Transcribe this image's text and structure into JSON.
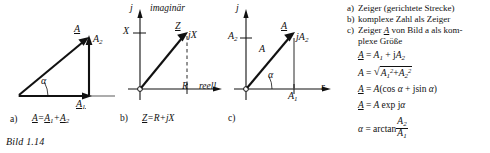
{
  "figure": {
    "caption": "Bild 1.14"
  },
  "diagram_a": {
    "item_letter": "a)",
    "labels": {
      "resultant": "A",
      "component_vertical": "A",
      "component_vertical_sub": "2",
      "component_horizontal": "A",
      "component_horizontal_sub": "1",
      "angle": "α"
    },
    "equation": {
      "lhs": "A",
      "eq": "=",
      "term1": "A",
      "term1_sub": "1",
      "plus": "+",
      "term2": "A",
      "term2_sub": "2"
    }
  },
  "diagram_b": {
    "item_letter": "b)",
    "axes": {
      "vertical_symbol": "j",
      "vertical_tick_label": "X",
      "vertical_name": "imaginär",
      "horizontal_tick_label": "R",
      "horizontal_name": "reell"
    },
    "labels": {
      "phasor": "Z",
      "imag_component": "jX"
    },
    "equation": {
      "lhs": "Z",
      "eq": "=",
      "term1": "R",
      "plus": "+",
      "term2": "jX"
    }
  },
  "diagram_c": {
    "item_letter": "c)",
    "axes": {
      "vertical_symbol": "j",
      "horizontal_symbol": "r",
      "vertical_tick_label": "A",
      "vertical_tick_sub": "2",
      "horizontal_tick_label": "A",
      "horizontal_tick_sub": "1"
    },
    "labels": {
      "phasor_underlined": "A",
      "magnitude": "A",
      "imag_component": "jA",
      "imag_component_sub": "2",
      "angle": "α"
    }
  },
  "legend": {
    "items": [
      {
        "letter": "a)",
        "text": "Zeiger (gerichtete Strecke)"
      },
      {
        "letter": "b)",
        "text": "komplexe Zahl als Zeiger"
      },
      {
        "letter": "c)",
        "text_line1_pre": "Zeiger ",
        "text_line1_sym": "A",
        "text_line1_post": " von Bild a als kom-",
        "text_line2": "plexe Größe"
      }
    ],
    "formulas": [
      {
        "id": "f1",
        "lhs": "A",
        "lhs_underline": true,
        "eq": "=",
        "rhs": "A₁ + jA₂",
        "parts": {
          "a1": "A",
          "a1_sub": "1",
          "plus": "+",
          "j": "j",
          "a2": "A",
          "a2_sub": "2"
        }
      },
      {
        "id": "f2",
        "lhs": "A",
        "lhs_underline": false,
        "eq": "=",
        "parts": {
          "radical": "√",
          "a1": "A",
          "a1_sub": "1",
          "a1_sup": "2",
          "plus": "+",
          "a2": "A",
          "a2_sub": "2",
          "a2_sup": "2"
        }
      },
      {
        "id": "f3",
        "lhs": "A",
        "lhs_underline": true,
        "eq": "=",
        "parts": {
          "mag": "A",
          "open": "(",
          "cos": "cos",
          "alpha": "α",
          "plus": "+",
          "j": "j",
          "sin": "sin",
          "alpha2": "α",
          "close": ")"
        }
      },
      {
        "id": "f4",
        "lhs": "A",
        "lhs_underline": true,
        "eq": "=",
        "parts": {
          "mag": "A",
          "exp": "exp",
          "j": "j",
          "alpha": "α"
        }
      },
      {
        "id": "f5",
        "lhs": "α",
        "lhs_underline": false,
        "eq": "=",
        "parts": {
          "fn": "arctan",
          "num": "A",
          "num_sub": "2",
          "den": "A",
          "den_sub": "1"
        }
      }
    ]
  },
  "colors": {
    "ink": "#111111",
    "paper": "#ffffff"
  }
}
